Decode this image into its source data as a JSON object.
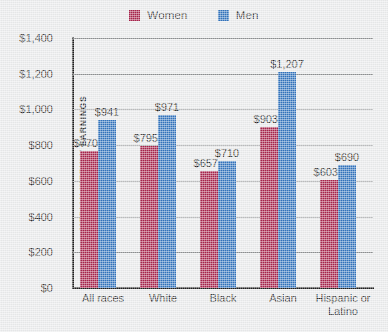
{
  "chart_data": {
    "type": "bar",
    "title": "",
    "xlabel": "",
    "ylabel": "MEDIAN WEEKLY EARNINGS",
    "ylim": [
      0,
      1400
    ],
    "ytick_step": 200,
    "ytick_labels": [
      "$1,400",
      "$1,200",
      "$1,000",
      "$800",
      "$600",
      "$400",
      "$200",
      "$0"
    ],
    "ytick_values": [
      1400,
      1200,
      1000,
      800,
      600,
      400,
      200,
      0
    ],
    "grid": true,
    "legend_position": "top-center",
    "categories": [
      "All races",
      "White",
      "Black",
      "Asian",
      "Hispanic or\nLatino"
    ],
    "series": [
      {
        "name": "Women",
        "color": "#a7234b",
        "values": [
          770,
          795,
          657,
          903,
          603
        ],
        "labels": [
          "$770",
          "$795",
          "$657",
          "$903",
          "$603"
        ]
      },
      {
        "name": "Men",
        "color": "#3173bd",
        "values": [
          941,
          971,
          710,
          1207,
          690
        ],
        "labels": [
          "$941",
          "$971",
          "$710",
          "$1,207",
          "$690"
        ]
      }
    ]
  },
  "legend": {
    "items": [
      {
        "label": "Women",
        "color": "#a7234b",
        "swatch_name": "legend-swatch-women"
      },
      {
        "label": "Men",
        "color": "#3173bd",
        "swatch_name": "legend-swatch-men"
      }
    ]
  },
  "colors": {
    "background": "#e9eaeb",
    "axis": "#1d1d1d",
    "gridline": "#8d8f91",
    "text": "#2f2f2f",
    "women": "#a7234b",
    "men": "#3173bd"
  }
}
